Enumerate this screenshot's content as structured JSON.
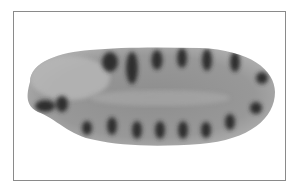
{
  "image": {
    "subject": "embryo-micrograph",
    "description": "Grayscale elongated oval embryo with repeating dark stripes (segments) along dorsal and ventral edges, enclosed in a thin rectangular frame",
    "colors": {
      "background": "#ffffff",
      "frame": "#8a8a8a",
      "embryo_body": "#9a9a9a",
      "embryo_light": "#bdbdbd",
      "stripe": "#2e2e2e"
    },
    "stripes_top": 7,
    "stripes_bottom": 8
  }
}
